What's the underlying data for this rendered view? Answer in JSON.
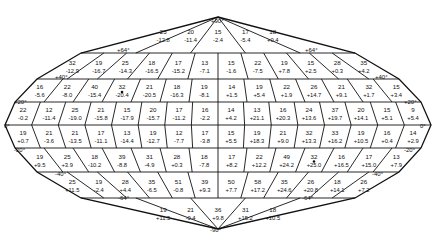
{
  "diagram": {
    "type": "equal-area sky map grid (Aitoff/Hammer-style) with per-cell counts and values",
    "latitude_labels": {
      "north_pole": "+90°",
      "north_64_left": "+64°",
      "north_64_right": "+64°",
      "north_40_left": "+40°",
      "north_40_right": "+40°",
      "north_20_left": "+20°",
      "north_20_right": "+20°",
      "equator_left": "0°",
      "equator_right": "0°",
      "south_20_left": "-20°",
      "south_20_right": "-20°",
      "south_40_left": "-40°",
      "south_40_right": "-40°",
      "south_64_left": "-64°",
      "south_64_right": "-64°",
      "south_pole": "-90°"
    },
    "bands": [
      {
        "name": "+64 to +90",
        "cells": [
          {
            "n": "23",
            "v": "-12.8"
          },
          {
            "n": "20",
            "v": "-11.4"
          },
          {
            "n": "15",
            "v": "-2.4"
          },
          {
            "n": "17",
            "v": "-5.4"
          },
          {
            "n": "18",
            "v": "+0.4"
          }
        ]
      },
      {
        "name": "+40 to +64",
        "cells": [
          {
            "n": "32",
            "v": "-12.9"
          },
          {
            "n": "19",
            "v": "-16.7"
          },
          {
            "n": "25",
            "v": "-14.3"
          },
          {
            "n": "18",
            "v": "-16.5"
          },
          {
            "n": "17",
            "v": "-15.2"
          },
          {
            "n": "13",
            "v": "-7.1"
          },
          {
            "n": "15",
            "v": "-1.6"
          },
          {
            "n": "22",
            "v": "-7.5"
          },
          {
            "n": "19",
            "v": "+7.8"
          },
          {
            "n": "15",
            "v": "+2.5"
          },
          {
            "n": "28",
            "v": "+0.3"
          },
          {
            "n": "35",
            "v": "+4.2"
          }
        ]
      },
      {
        "name": "+20 to +40",
        "cells": [
          {
            "n": "16",
            "v": "-5.6"
          },
          {
            "n": "22",
            "v": "-8.0"
          },
          {
            "n": "40",
            "v": "-15.4"
          },
          {
            "n": "32",
            "v": "-20.4"
          },
          {
            "n": "21",
            "v": "-20.5"
          },
          {
            "n": "18",
            "v": "-16.3"
          },
          {
            "n": "19",
            "v": "-8.1"
          },
          {
            "n": "14",
            "v": "+1.5"
          },
          {
            "n": "19",
            "v": "+5.4"
          },
          {
            "n": "22",
            "v": "+1.9"
          },
          {
            "n": "26",
            "v": "+14.7"
          },
          {
            "n": "21",
            "v": "+9.1"
          },
          {
            "n": "32",
            "v": "+1.7"
          },
          {
            "n": "15",
            "v": "+3.4"
          }
        ]
      },
      {
        "name": "0 to +20",
        "cells": [
          {
            "n": "22",
            "v": "-0.2"
          },
          {
            "n": "12",
            "v": "-11.4"
          },
          {
            "n": "25",
            "v": "-19.0"
          },
          {
            "n": "21",
            "v": "-15.8"
          },
          {
            "n": "15",
            "v": "-17.9"
          },
          {
            "n": "20",
            "v": "-15.7"
          },
          {
            "n": "17",
            "v": "-11.2"
          },
          {
            "n": "16",
            "v": "-2.2"
          },
          {
            "n": "14",
            "v": "+4.2"
          },
          {
            "n": "13",
            "v": "+21.1"
          },
          {
            "n": "16",
            "v": "+20.3"
          },
          {
            "n": "24",
            "v": "+13.6"
          },
          {
            "n": "37",
            "v": "+19.7"
          },
          {
            "n": "20",
            "v": "+14.1"
          },
          {
            "n": "15",
            "v": "+5.1"
          },
          {
            "n": "9",
            "v": "+5.4"
          }
        ]
      },
      {
        "name": "-20 to 0",
        "cells": [
          {
            "n": "19",
            "v": "+0.7"
          },
          {
            "n": "21",
            "v": "-3.6"
          },
          {
            "n": "21",
            "v": "-13.5"
          },
          {
            "n": "17",
            "v": "-11.1"
          },
          {
            "n": "13",
            "v": "-14.4"
          },
          {
            "n": "19",
            "v": "-12.7"
          },
          {
            "n": "12",
            "v": "-7.7"
          },
          {
            "n": "17",
            "v": "-3.8"
          },
          {
            "n": "15",
            "v": "+5.5"
          },
          {
            "n": "19",
            "v": "+18.3"
          },
          {
            "n": "21",
            "v": "+9.0"
          },
          {
            "n": "32",
            "v": "+13.3"
          },
          {
            "n": "33",
            "v": "+16.2"
          },
          {
            "n": "19",
            "v": "+10.5"
          },
          {
            "n": "16",
            "v": "+0.4"
          },
          {
            "n": "14",
            "v": "+2.9"
          }
        ]
      },
      {
        "name": "-40 to -20",
        "cells": [
          {
            "n": "19",
            "v": "+9.5"
          },
          {
            "n": "25",
            "v": "+3.9"
          },
          {
            "n": "18",
            "v": "-10.2"
          },
          {
            "n": "39",
            "v": "-8.8"
          },
          {
            "n": "31",
            "v": "-4.9"
          },
          {
            "n": "28",
            "v": "+0.3"
          },
          {
            "n": "18",
            "v": "-7.8"
          },
          {
            "n": "17",
            "v": "+8.2"
          },
          {
            "n": "22",
            "v": "+12.2"
          },
          {
            "n": "49",
            "v": "+24.2"
          },
          {
            "n": "32",
            "v": "+25.0"
          },
          {
            "n": "16",
            "v": "+16.5"
          },
          {
            "n": "17",
            "v": "+15.0"
          },
          {
            "n": "13",
            "v": "+7.9"
          }
        ]
      },
      {
        "name": "-64 to -40",
        "cells": [
          {
            "n": "25",
            "v": "+11.5"
          },
          {
            "n": "19",
            "v": "-2.4"
          },
          {
            "n": "28",
            "v": "+4.4"
          },
          {
            "n": "35",
            "v": "-6.5"
          },
          {
            "n": "51",
            "v": "-0.8"
          },
          {
            "n": "39",
            "v": "+9.3"
          },
          {
            "n": "50",
            "v": "+7.7"
          },
          {
            "n": "58",
            "v": "+17.2"
          },
          {
            "n": "35",
            "v": "+24.6"
          },
          {
            "n": "26",
            "v": "+20.8"
          },
          {
            "n": "18",
            "v": "+14.1"
          },
          {
            "n": "26",
            "v": "+7.2"
          }
        ]
      },
      {
        "name": "-90 to -64",
        "cells": [
          {
            "n": "19",
            "v": "+11.5"
          },
          {
            "n": "21",
            "v": "-0.4"
          },
          {
            "n": "36",
            "v": "+9.8"
          },
          {
            "n": "31",
            "v": "+15.2"
          },
          {
            "n": "18",
            "v": "+10.5"
          }
        ]
      }
    ],
    "markers": [
      {
        "band": "+20 to +40",
        "cell_index": 3,
        "symbol": "dot"
      },
      {
        "band": "-40 to -20",
        "cell_index": 10,
        "symbol": "dot"
      }
    ]
  }
}
